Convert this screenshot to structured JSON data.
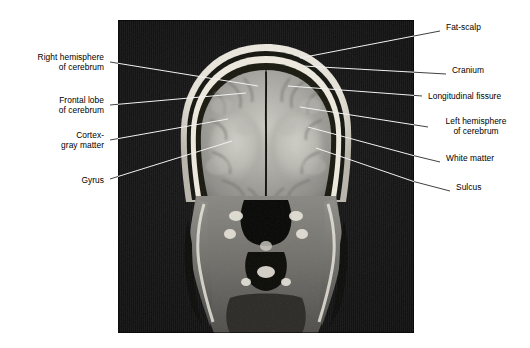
{
  "figure": {
    "kind": "coronal-mri-brain",
    "modality": "MRI",
    "plane": "coronal",
    "colors": {
      "background": "#ffffff",
      "label_text": "#000000",
      "leader_line": "#2b2b2b",
      "leader_line_on_film": "#f2f2f2",
      "film_black": "#0b0b0b",
      "bright_fat": "#f0ede6",
      "gray_matter": "#9a9a96",
      "white_matter": "#c3c2bc",
      "bone_dark": "#1b1b1b"
    },
    "plate": {
      "x": 118,
      "y": 20,
      "width": 296,
      "height": 313
    }
  },
  "labels_left": [
    {
      "id": "right-hemisphere",
      "lines": [
        "Right hemisphere",
        "of cerebrum"
      ],
      "text_right": 104,
      "text_top": 52
    },
    {
      "id": "frontal-lobe",
      "lines": [
        "Frontal lobe",
        "of cerebrum"
      ],
      "text_right": 104,
      "text_top": 95
    },
    {
      "id": "cortex-gray-matter",
      "lines": [
        "Cortex-",
        "gray matter"
      ],
      "text_right": 104,
      "text_top": 130
    },
    {
      "id": "gyrus",
      "lines": [
        "Gyrus"
      ],
      "text_right": 104,
      "text_top": 175
    }
  ],
  "labels_right": [
    {
      "id": "fat-scalp",
      "lines": [
        "Fat-scalp"
      ],
      "text_left": 446,
      "text_top": 22
    },
    {
      "id": "cranium",
      "lines": [
        "Cranium"
      ],
      "text_left": 452,
      "text_top": 65
    },
    {
      "id": "longitudinal-fissure",
      "lines": [
        "Longitudinal fissure"
      ],
      "text_left": 428,
      "text_top": 91
    },
    {
      "id": "left-hemisphere",
      "lines": [
        "Left hemisphere",
        "of cerebrum"
      ],
      "text_left": 434,
      "text_top": 116
    },
    {
      "id": "white-matter",
      "lines": [
        "White matter"
      ],
      "text_left": 446,
      "text_top": 153
    },
    {
      "id": "sulcus",
      "lines": [
        "Sulcus"
      ],
      "text_left": 456,
      "text_top": 182
    }
  ],
  "leaders": [
    {
      "id": "lead-right-hemisphere",
      "x1": 110,
      "y1": 62,
      "x2": 258,
      "y2": 86
    },
    {
      "id": "lead-frontal-lobe",
      "x1": 110,
      "y1": 105,
      "x2": 246,
      "y2": 93
    },
    {
      "id": "lead-cortex-gray-matter",
      "x1": 110,
      "y1": 140,
      "x2": 228,
      "y2": 119
    },
    {
      "id": "lead-gyrus",
      "x1": 110,
      "y1": 179,
      "x2": 232,
      "y2": 141
    },
    {
      "id": "lead-fat-scalp",
      "x1": 440,
      "y1": 31,
      "x2": 300,
      "y2": 58
    },
    {
      "id": "lead-cranium",
      "x1": 446,
      "y1": 74,
      "x2": 303,
      "y2": 66
    },
    {
      "id": "lead-longitudinal-fissure",
      "x1": 422,
      "y1": 96,
      "x2": 288,
      "y2": 86
    },
    {
      "id": "lead-left-hemisphere",
      "x1": 428,
      "y1": 127,
      "x2": 300,
      "y2": 107
    },
    {
      "id": "lead-white-matter",
      "x1": 440,
      "y1": 162,
      "x2": 308,
      "y2": 127
    },
    {
      "id": "lead-sulcus",
      "x1": 450,
      "y1": 191,
      "x2": 316,
      "y2": 148
    }
  ],
  "anatomy_notes": {
    "visible_structures": [
      "fat-scalp",
      "cranium",
      "longitudinal fissure",
      "cerebral hemispheres",
      "cortex gray matter",
      "white matter",
      "gyri",
      "sulci",
      "temporalis muscle",
      "nasal cavity",
      "maxillary sinuses",
      "skull base"
    ]
  }
}
